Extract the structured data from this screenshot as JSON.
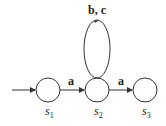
{
  "diagram": {
    "type": "finite-automaton",
    "start_state": "s1",
    "states": [
      {
        "id": "s1",
        "name": "s",
        "sub": "1",
        "cx": 48,
        "cy": 90,
        "r": 12
      },
      {
        "id": "s2",
        "name": "s",
        "sub": "2",
        "cx": 97,
        "cy": 90,
        "r": 12
      },
      {
        "id": "s3",
        "name": "s",
        "sub": "3",
        "cx": 145,
        "cy": 90,
        "r": 12
      }
    ],
    "transitions": [
      {
        "from": "s1",
        "to": "s2",
        "label": "a"
      },
      {
        "from": "s2",
        "to": "s2",
        "label": "b, c"
      },
      {
        "from": "s2",
        "to": "s3",
        "label": "a"
      }
    ],
    "colors": {
      "stroke": "#333333",
      "background": "#ffffff"
    }
  }
}
